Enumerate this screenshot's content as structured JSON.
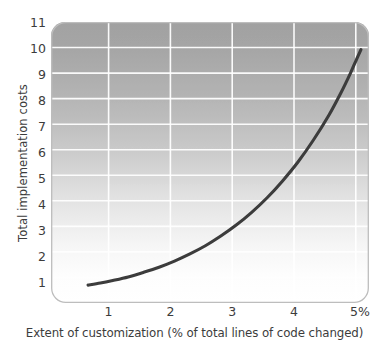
{
  "chart_data": {
    "type": "line",
    "title": "",
    "xlabel": "Extent of customization (% of total lines of code changed)",
    "ylabel": "Total implementation costs",
    "xlim": [
      0,
      5.15
    ],
    "ylim": [
      0,
      11
    ],
    "xticks": [
      1,
      2,
      3,
      4,
      5
    ],
    "xtick_labels": [
      "1",
      "2",
      "3",
      "4",
      "5%"
    ],
    "yticks": [
      1,
      2,
      3,
      4,
      5,
      6,
      7,
      8,
      9,
      10,
      11
    ],
    "ytick_labels": [
      "1",
      "2",
      "3",
      "4",
      "5",
      "6",
      "7",
      "8",
      "9",
      "10",
      "11"
    ],
    "grid": "horizontal-and-vertical",
    "legend": "none",
    "series": [
      {
        "name": "Total implementation costs",
        "color": "#3c3c3c",
        "x": [
          0.6,
          0.8,
          1.0,
          1.25,
          1.5,
          1.75,
          2.0,
          2.25,
          2.5,
          2.75,
          3.0,
          3.25,
          3.5,
          3.75,
          4.0,
          4.25,
          4.5,
          4.7,
          4.85,
          4.95,
          5.02
        ],
        "y": [
          0.7,
          0.78,
          0.88,
          1.02,
          1.2,
          1.4,
          1.64,
          1.92,
          2.24,
          2.62,
          3.05,
          3.55,
          4.12,
          4.78,
          5.52,
          6.38,
          7.35,
          8.25,
          9.0,
          9.55,
          9.92
        ]
      }
    ],
    "panel": {
      "gradient_top_color": "#a8a8a8",
      "gradient_bottom_color": "#ffffff",
      "gridline_color": "#ffffff",
      "border_color": "#bdbdbd",
      "corner_radius": 14
    }
  },
  "axis": {
    "y_title": "Total implementation costs",
    "x_title": "Extent of customization (% of total lines of code changed)",
    "y_labels": [
      "11",
      "10",
      "9",
      "8",
      "7",
      "6",
      "5",
      "4",
      "3",
      "2",
      "1"
    ],
    "x_labels": [
      "1",
      "2",
      "3",
      "4",
      "5%"
    ]
  }
}
